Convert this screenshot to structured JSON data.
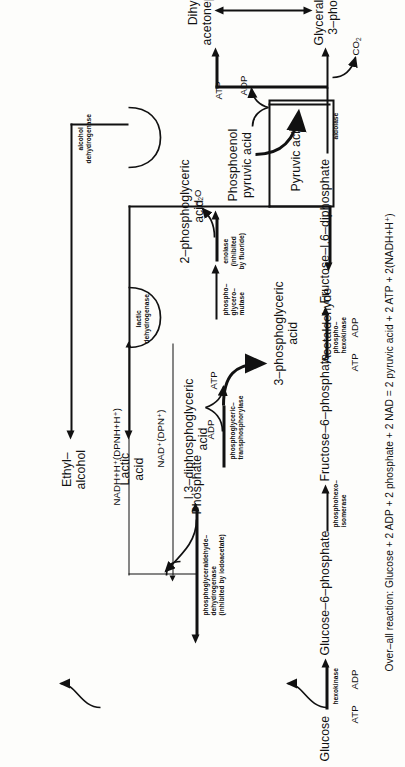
{
  "figure": {
    "type": "metabolic-pathway-diagram",
    "orientation": "rotated-90-ccw"
  },
  "metabolites": {
    "glucose": "Glucose",
    "glucose_6_phosphate": "Glucose–6–phosphate",
    "fructose_6_phosphate": "Fructose–6–phosphate",
    "fructose_16_diphosphate": "Fructose–I,6–diphosphate",
    "dihydroxyacetone_l1": "Dihydroxy–",
    "dihydroxyacetone_l2": "acetonephosphate",
    "glyceraldehyde_l1": "Glyceraldehyde–",
    "glyceraldehyde_l2": "3–phosphate",
    "dpg_l1": "I,3–diphosphoglyceric",
    "dpg_l2": "acid",
    "pga3_l1": "3–phosphoglyceric",
    "pga3_l2": "acid",
    "pga2_l1": "2–phosphoglyceric",
    "pga2_l2": "acid",
    "pep_l1": "Phosphoenol",
    "pep_l2": "pyruvic acid",
    "pyruvic_acid": "Pyruvic acid",
    "acetaldehyde": "Acetaldehyde",
    "ethyl_alcohol_l1": "Ethyl–",
    "ethyl_alcohol_l2": "alcohol",
    "lactic_acid_l1": "Lactic",
    "lactic_acid_l2": "acid",
    "phosphate": "Phosphate"
  },
  "enzymes": {
    "hexokinase": "hexokinase",
    "phosphohexoisomerase_l1": "phosphohexo–",
    "phosphohexoisomerase_l2": "isomerase",
    "phosphohexokinase_l1": "phospho–",
    "phosphohexokinase_l2": "hexokinase",
    "aldolase": "aldolase",
    "pgald_dh_l1": "phosphoglyceraldehyde–",
    "pgald_dh_l2": "dehydrogenase",
    "pgald_dh_l3": "(inhibited by iodoacetate)",
    "transphosphorylase_l1": "phosphoglyceric–",
    "transphosphorylase_l2": "transphosphorylase",
    "mutase_l1": "phospho–",
    "mutase_l2": "glycero–",
    "mutase_l3": "mutase",
    "enolase_l1": "enolase",
    "enolase_l2": "(inhibited",
    "enolase_l3": "by fluoride)",
    "lactic_dh_l1": "lactic",
    "lactic_dh_l2": "dehydrogenase",
    "alcohol_dh_l1": "alcohol",
    "alcohol_dh_l2": "dehydrogenase"
  },
  "cofactors": {
    "atp_1": "ATP",
    "adp_1": "ADP",
    "atp_2": "ATP",
    "adp_2": "ADP",
    "adp_3": "ADP",
    "atp_3": "ATP",
    "adp_4": "ADP",
    "atp_4": "ATP",
    "nad_ox": "NAD⁺(DPN⁺)",
    "nad_red": "NADH+H⁺(DPNH+H⁺)",
    "water": "H₂O",
    "carbon_dioxide": "CO₂"
  },
  "overall": {
    "reaction": "Over–all reaction: Glucose + 2 ADP + 2 phosphate + 2 NAD = 2 pyruvic acid + 2 ATP + 2(NADH+H⁺)"
  },
  "colors": {
    "ink": "#111111",
    "paper": "#fdfdfb"
  }
}
